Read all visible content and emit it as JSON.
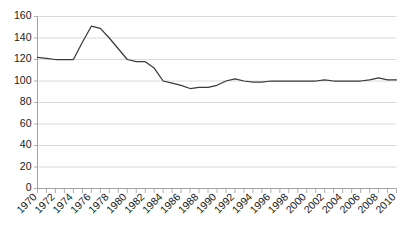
{
  "figure": {
    "clipped_header_text": "",
    "background_color": "#ffffff",
    "line_color": "#3a3a3a",
    "grid_color": "#d0d0d0",
    "axis_color": "#9a9a9a"
  },
  "chart_data": {
    "type": "line",
    "title": "",
    "subtitle": "",
    "xlabel": "",
    "ylabel": "",
    "xlim": [
      1970,
      2010
    ],
    "ylim": [
      0,
      160
    ],
    "ytick_labels": [
      "0",
      "20",
      "40",
      "60",
      "80",
      "100",
      "120",
      "140",
      "160"
    ],
    "ytick_values": [
      0,
      20,
      40,
      60,
      80,
      100,
      120,
      140,
      160
    ],
    "xtick_labels": [
      "1970",
      "1972",
      "1974",
      "1976",
      "1978",
      "1980",
      "1982",
      "1984",
      "1986",
      "1988",
      "1990",
      "1992",
      "1994",
      "1996",
      "1998",
      "2000",
      "2002",
      "2004",
      "2006",
      "2008",
      "2010"
    ],
    "xtick_label_values": [
      1970,
      1972,
      1974,
      1976,
      1978,
      1980,
      1982,
      1984,
      1986,
      1988,
      1990,
      1992,
      1994,
      1996,
      1998,
      2000,
      2002,
      2004,
      2006,
      2008,
      2010
    ],
    "xtick_label_rotation": -45,
    "minor_xticks_every": 1,
    "grid": "horizontal",
    "legend": "none",
    "x": [
      1970,
      1971,
      1972,
      1973,
      1974,
      1975,
      1976,
      1977,
      1978,
      1979,
      1980,
      1981,
      1982,
      1983,
      1984,
      1985,
      1986,
      1987,
      1988,
      1989,
      1990,
      1991,
      1992,
      1993,
      1994,
      1995,
      1996,
      1997,
      1998,
      1999,
      2000,
      2001,
      2002,
      2003,
      2004,
      2005,
      2006,
      2007,
      2008,
      2009,
      2010
    ],
    "values": [
      122,
      121,
      120,
      120,
      120,
      136,
      151,
      149,
      140,
      130,
      120,
      118,
      118,
      112,
      100,
      98,
      96,
      93,
      94,
      94,
      96,
      100,
      102,
      100,
      99,
      99,
      100,
      100,
      100,
      100,
      100,
      100,
      101,
      100,
      100,
      100,
      100,
      101,
      103,
      101,
      101
    ],
    "series": [
      {
        "name": "index",
        "values": [
          122,
          121,
          120,
          120,
          120,
          136,
          151,
          149,
          140,
          130,
          120,
          118,
          118,
          112,
          100,
          98,
          96,
          93,
          94,
          94,
          96,
          100,
          102,
          100,
          99,
          99,
          100,
          100,
          100,
          100,
          100,
          100,
          101,
          100,
          100,
          100,
          100,
          101,
          103,
          101,
          101
        ]
      }
    ]
  }
}
